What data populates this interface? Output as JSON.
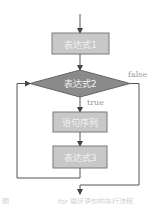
{
  "diagram": {
    "type": "flowchart-for-loop",
    "nodes": [
      {
        "id": "expr1",
        "shape": "rect",
        "label": "表达式1"
      },
      {
        "id": "expr2",
        "shape": "diamond",
        "label": "表达式2"
      },
      {
        "id": "stmts",
        "shape": "rect",
        "label": "语句序列"
      },
      {
        "id": "expr3",
        "shape": "rect",
        "label": "表达式3"
      }
    ],
    "edges": [
      {
        "from": "start",
        "to": "expr1"
      },
      {
        "from": "expr1",
        "to": "expr2"
      },
      {
        "from": "expr2",
        "to": "stmts",
        "label": "true"
      },
      {
        "from": "stmts",
        "to": "expr3"
      },
      {
        "from": "expr3",
        "to": "expr2"
      },
      {
        "from": "expr2",
        "to": "end",
        "label": "false"
      }
    ],
    "labels": {
      "true": "true",
      "false": "false"
    },
    "colors": {
      "rect_fill": "#c8c8c8",
      "rect_stroke": "#7a7a7a",
      "diamond_fill": "#8a8a8a",
      "diamond_stroke": "#666666",
      "node_text": "#f2f2f2",
      "line": "#555555",
      "edge_label": "#9a9a9a"
    },
    "caption_left": "图",
    "caption_right": "for 循环语句的执行流程"
  }
}
